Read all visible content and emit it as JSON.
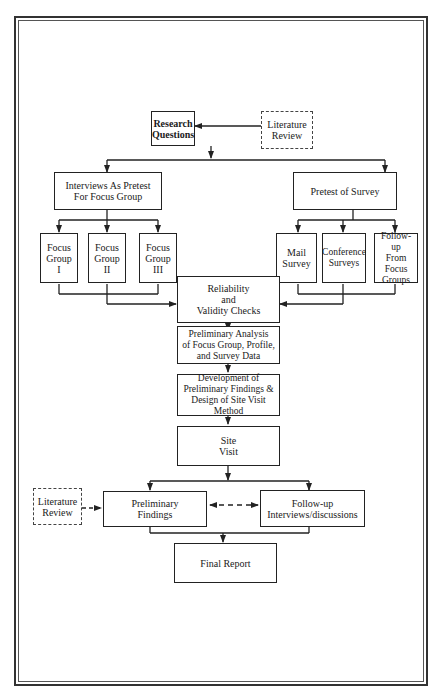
{
  "diagram": {
    "type": "flowchart",
    "nodes": {
      "lit_review_top": {
        "label": "Literature\nReview",
        "style": "dashed"
      },
      "research_questions": {
        "label": "Research\nQuestions",
        "style": "solid-bold"
      },
      "interviews_pretest": {
        "label": "Interviews As Pretest\nFor Focus Group"
      },
      "pretest_survey": {
        "label": "Pretest of Survey"
      },
      "focus_group_1": {
        "label": "Focus\nGroup\nI"
      },
      "focus_group_2": {
        "label": "Focus\nGroup\nII"
      },
      "focus_group_3": {
        "label": "Focus\nGroup\nIII"
      },
      "mail_survey": {
        "label": "Mail\nSurvey"
      },
      "conference_surveys": {
        "label": "Conference\nSurveys"
      },
      "followup_focus": {
        "label": "Follow-up\nFrom Focus\nGroups"
      },
      "reliability": {
        "label": "Reliability\nand\nValidity Checks"
      },
      "prelim_analysis": {
        "label": "Preliminary Analysis\nof Focus Group, Profile,\nand Survey Data"
      },
      "development": {
        "label": "Development of\nPreliminary Findings &\nDesign of Site Visit\nMethod"
      },
      "site_visit": {
        "label": "Site\nVisit"
      },
      "lit_review_bottom": {
        "label": "Literature\nReview",
        "style": "dashed"
      },
      "prelim_findings": {
        "label": "Preliminary\nFindings"
      },
      "followup_interviews": {
        "label": "Follow-up\nInterviews/discussions"
      },
      "final_report": {
        "label": "Final Report"
      }
    },
    "edges": [
      {
        "from": "lit_review_top",
        "to": "research_questions"
      },
      {
        "from": "research_questions",
        "to": "interviews_pretest"
      },
      {
        "from": "research_questions",
        "to": "pretest_survey"
      },
      {
        "from": "interviews_pretest",
        "to": "focus_group_1"
      },
      {
        "from": "interviews_pretest",
        "to": "focus_group_2"
      },
      {
        "from": "interviews_pretest",
        "to": "focus_group_3"
      },
      {
        "from": "pretest_survey",
        "to": "mail_survey"
      },
      {
        "from": "pretest_survey",
        "to": "conference_surveys"
      },
      {
        "from": "pretest_survey",
        "to": "followup_focus"
      },
      {
        "from": "focus_group_1",
        "to": "reliability"
      },
      {
        "from": "focus_group_2",
        "to": "reliability"
      },
      {
        "from": "focus_group_3",
        "to": "reliability"
      },
      {
        "from": "mail_survey",
        "to": "reliability"
      },
      {
        "from": "conference_surveys",
        "to": "reliability"
      },
      {
        "from": "followup_focus",
        "to": "reliability"
      },
      {
        "from": "reliability",
        "to": "prelim_analysis"
      },
      {
        "from": "prelim_analysis",
        "to": "development"
      },
      {
        "from": "development",
        "to": "site_visit"
      },
      {
        "from": "site_visit",
        "to": "prelim_findings"
      },
      {
        "from": "site_visit",
        "to": "followup_interviews"
      },
      {
        "from": "lit_review_bottom",
        "to": "prelim_findings",
        "style": "dashed"
      },
      {
        "from": "prelim_findings",
        "to": "followup_interviews",
        "style": "dashed-bidirectional"
      },
      {
        "from": "prelim_findings",
        "to": "final_report"
      },
      {
        "from": "followup_interviews",
        "to": "final_report"
      }
    ]
  }
}
